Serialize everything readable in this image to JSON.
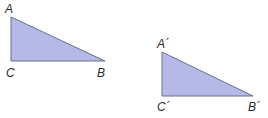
{
  "figure": {
    "colors": {
      "fill": "#b6b9e8",
      "stroke": "#6a6e8c",
      "label": "#2a2a2a"
    },
    "triangles": [
      {
        "name": "ABC",
        "vertices": {
          "A": {
            "label": "A",
            "x": 11,
            "y": 17,
            "lx": 5,
            "ly": 13
          },
          "C": {
            "label": "C",
            "x": 11,
            "y": 61,
            "lx": 6,
            "ly": 77
          },
          "B": {
            "label": "B",
            "x": 105,
            "y": 61,
            "lx": 97,
            "ly": 77
          }
        }
      },
      {
        "name": "A'B'C'",
        "vertices": {
          "A": {
            "label": "A´",
            "x": 162,
            "y": 52,
            "lx": 157,
            "ly": 48
          },
          "C": {
            "label": "C´",
            "x": 162,
            "y": 96,
            "lx": 157,
            "ly": 111
          },
          "B": {
            "label": "B´",
            "x": 253,
            "y": 96,
            "lx": 248,
            "ly": 111
          }
        }
      }
    ]
  }
}
